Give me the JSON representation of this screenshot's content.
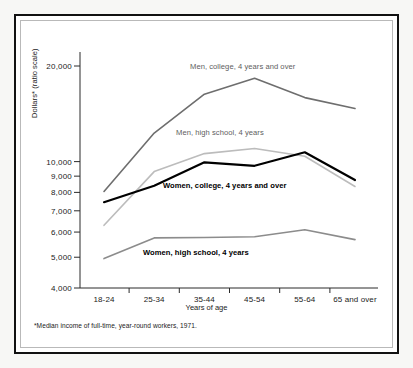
{
  "chart_data": {
    "type": "line",
    "title": "",
    "xlabel": "Years of age",
    "ylabel": "Dollars* (ratio scale)",
    "scale": "log",
    "grid": false,
    "legend_position": "inline-annotations",
    "categories": [
      "18-24",
      "25-34",
      "35-44",
      "45-54",
      "55-64",
      "65 and over"
    ],
    "ylim": [
      4000,
      22000
    ],
    "ytick_labels": [
      "20,000",
      "10,000",
      "9,000",
      "8,000",
      "7,000",
      "6,000",
      "5,000",
      "4,000"
    ],
    "ytick_values": [
      20000,
      10000,
      9000,
      8000,
      7000,
      6000,
      5000,
      4000
    ],
    "series": [
      {
        "name": "Men, college, 4 years and over",
        "color": "#6e6e6e",
        "values": [
          8050,
          12300,
          16300,
          18300,
          15900,
          14700
        ]
      },
      {
        "name": "Men, high school, 4 years",
        "color": "#bcbcbc",
        "values": [
          6300,
          9300,
          10600,
          11000,
          10400,
          8350
        ]
      },
      {
        "name": "Women, college, 4 years and over",
        "color": "#000000",
        "values": [
          7450,
          8400,
          9950,
          9700,
          10700,
          8750
        ]
      },
      {
        "name": "Women, high school, 4 years",
        "color": "#8c8c8c",
        "values": [
          4950,
          5750,
          5770,
          5800,
          6100,
          5680
        ]
      }
    ],
    "annotations": [
      {
        "text": "Men, college, 4 years and over",
        "style": "grey"
      },
      {
        "text": "Men, high school, 4 years",
        "style": "grey"
      },
      {
        "text": "Women, college, 4 years and over",
        "style": "black"
      },
      {
        "text": "Women, high school, 4 years",
        "style": "black"
      }
    ],
    "footnote": "*Median income of full-time, year-round workers, 1971."
  }
}
